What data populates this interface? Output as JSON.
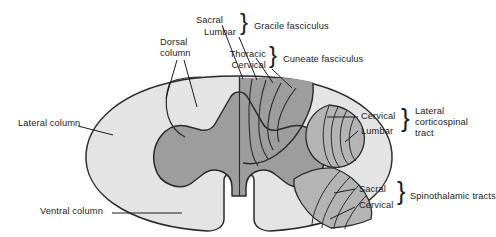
{
  "figure": {
    "colors": {
      "white_matter": "#e4e4e4",
      "gray_matter": "#9d9d9d",
      "tract_shaded": "#b4b4b4",
      "outline": "#2b2b2b",
      "leader": "#1c1c1c",
      "background": "#ffffff",
      "text": "#1c1c1c"
    }
  },
  "labels": {
    "lateral_column": "Lateral column",
    "ventral_column": "Ventral column",
    "dorsal_column": "Dorsal\ncolumn",
    "dorsal_column_line1": "Dorsal",
    "dorsal_column_line2": "column",
    "sacral_top": "Sacral",
    "lumbar_top": "Lumbar",
    "thoracic": "Thoracic",
    "cervical_top": "Cervical",
    "gracile_fasciculus": "Gracile fasciculus",
    "cuneate_fasciculus": "Cuneate fasciculus",
    "cervical_cst": "Cervical",
    "lumbar_cst": "Lumbar",
    "lateral_corticospinal_tract": "Lateral\ncorticospinal\ntract",
    "lct_line1": "Lateral",
    "lct_line2": "corticospinal",
    "lct_line3": "tract",
    "sacral_stt": "Sacral",
    "cervical_stt": "Cervical",
    "spinothalamic_tracts": "Spinothalamic tracts",
    "brace_glyph": "}"
  },
  "groups": [
    {
      "name": "gracile-fasciculus",
      "members": [
        "Sacral",
        "Lumbar"
      ],
      "label": "Gracile fasciculus"
    },
    {
      "name": "cuneate-fasciculus",
      "members": [
        "Thoracic",
        "Cervical"
      ],
      "label": "Cuneate fasciculus"
    },
    {
      "name": "lateral-corticospinal-tract",
      "members": [
        "Cervical",
        "Lumbar"
      ],
      "label": "Lateral corticospinal tract"
    },
    {
      "name": "spinothalamic-tracts",
      "members": [
        "Sacral",
        "Cervical"
      ],
      "label": "Spinothalamic tracts"
    }
  ]
}
